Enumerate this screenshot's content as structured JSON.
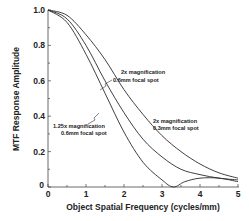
{
  "chart_data": {
    "type": "line",
    "title": "",
    "xlabel": "Object Spatial Frequency (cycles/mm)",
    "ylabel": "MTF Response Amplitude",
    "xlim": [
      0,
      5
    ],
    "ylim": [
      0,
      1.0
    ],
    "x_ticks": [
      "0",
      "1",
      "2",
      "3",
      "4",
      "5"
    ],
    "y_ticks": [
      "0",
      "0.2",
      "0.4",
      "0.6",
      "0.8",
      "1.0"
    ],
    "grid": false,
    "legend": "inline annotations",
    "series": [
      {
        "name": "2x magnification 0.3mm focal spot",
        "x": [
          0,
          0.5,
          1,
          1.5,
          2,
          2.5,
          3,
          3.5,
          4,
          4.5,
          5
        ],
        "values": [
          1.0,
          0.97,
          0.86,
          0.72,
          0.55,
          0.41,
          0.29,
          0.2,
          0.13,
          0.08,
          0.05
        ]
      },
      {
        "name": "2x magnification 0.6mm focal spot",
        "x": [
          0,
          0.5,
          1,
          1.5,
          2,
          2.5,
          3,
          3.5,
          4,
          4.5,
          5
        ],
        "values": [
          1.0,
          0.95,
          0.8,
          0.6,
          0.42,
          0.27,
          0.17,
          0.1,
          0.07,
          0.05,
          0.04
        ]
      },
      {
        "name": "1.25x magnification 0.6mm focal spot",
        "x": [
          0,
          0.5,
          1,
          1.5,
          2,
          2.5,
          3,
          3.3,
          3.6,
          4,
          4.5,
          5
        ],
        "values": [
          1.0,
          0.93,
          0.75,
          0.53,
          0.31,
          0.14,
          0.04,
          0.0,
          0.03,
          0.05,
          0.05,
          0.03
        ]
      }
    ],
    "annotations": [
      {
        "line1": "2x  magnification",
        "line2": "0.6mm focal spot"
      },
      {
        "line1": "2x  magnification",
        "line2": "0.3mm focal spot"
      },
      {
        "line1": "1.25x  magnification",
        "line2": "0.6mm focal spot"
      }
    ]
  }
}
